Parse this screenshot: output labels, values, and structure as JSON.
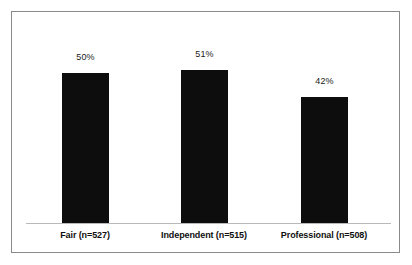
{
  "chart_data": {
    "type": "bar",
    "title": "",
    "subtitle": "",
    "xlabel": "",
    "ylabel": "",
    "categories": [
      "Fair (n=527)",
      "Independent (n=515)",
      "Professional (n=508)"
    ],
    "values": [
      50,
      51,
      42
    ],
    "value_labels": [
      "50%",
      "51%",
      "42%"
    ],
    "ylim": [
      0,
      60
    ],
    "grid": false,
    "legend": null,
    "y_axis_visible": false,
    "y_tick_labels": [],
    "x_axis_visible": true,
    "bar_color": "#0d0d0d",
    "axis_color": "#b9b9b9",
    "frame_color": "#8a8a8a",
    "background_color": "#ffffff",
    "value_label_color": "#1a1a1a",
    "category_label_color": "#0f0f0f"
  },
  "bars": [
    {
      "category": "Fair (n=527)",
      "value_label": "50%",
      "value": 50
    },
    {
      "category": "Independent (n=515)",
      "value_label": "51%",
      "value": 51
    },
    {
      "category": "Professional (n=508)",
      "value_label": "42%",
      "value": 42
    }
  ]
}
